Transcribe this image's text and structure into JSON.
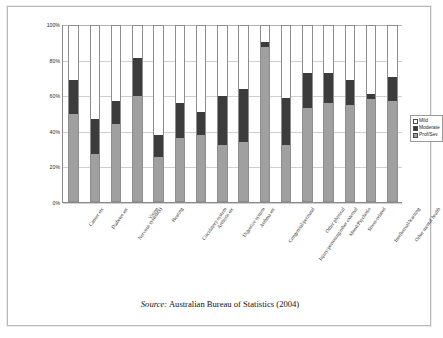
{
  "figure": {
    "source_label": "Source:",
    "source_text": " Australian Bureau of Statistics (2004)"
  },
  "legend": {
    "position": "right",
    "items": [
      {
        "label": "Mild",
        "color": "#ffffff"
      },
      {
        "label": "Moderate",
        "color": "#3c3c3c"
      },
      {
        "label": "Prof/Sev",
        "color": "#a0a0a0"
      }
    ]
  },
  "chart_data": {
    "type": "bar",
    "stacked": true,
    "title": "",
    "subtitle": "",
    "xlabel": "",
    "ylabel": "",
    "ylim": [
      0,
      100
    ],
    "ytick_labels": [
      "0%",
      "20%",
      "40%",
      "60%",
      "80%",
      "100%"
    ],
    "ytick_values": [
      0,
      20,
      40,
      60,
      80,
      100
    ],
    "grid": true,
    "grid_axis": "y",
    "legend_position": "right",
    "categories": [
      "Cancer etc",
      "Diabetes etc",
      "Nervous system(s)",
      "Vision",
      "Hearing",
      "Circulatory system",
      "Arthritis etc",
      "Digestive system",
      "Asthma etc",
      "Congenital/perinatal",
      "Injury/poisoning/other external",
      "Other physical",
      "Mood/Psychosis",
      "Stress-related",
      "Intellectual/learning",
      "Other mental health"
    ],
    "series": [
      {
        "name": "Prof/Sev",
        "color": "#a0a0a0",
        "values": [
          50,
          27,
          44,
          60,
          25,
          36,
          38,
          32,
          34,
          88,
          32,
          53,
          56,
          55,
          58,
          57
        ]
      },
      {
        "name": "Moderate",
        "color": "#3c3c3c",
        "values": [
          19,
          20,
          13,
          22,
          13,
          20,
          13,
          28,
          30,
          3,
          27,
          20,
          17,
          14,
          3,
          14
        ]
      },
      {
        "name": "Mild",
        "color": "#ffffff",
        "values": [
          31,
          53,
          43,
          18,
          62,
          44,
          49,
          40,
          36,
          9,
          41,
          27,
          27,
          31,
          39,
          29
        ]
      }
    ]
  }
}
